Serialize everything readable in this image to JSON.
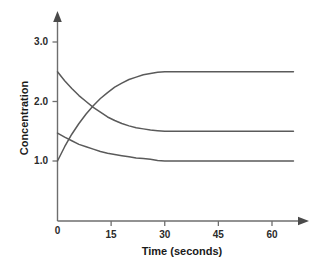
{
  "chart_data": {
    "type": "line",
    "title": "",
    "subtitle": "",
    "xlabel": "Time (seconds)",
    "ylabel": "Concentration",
    "xlim": [
      0,
      68
    ],
    "ylim": [
      0,
      3.35
    ],
    "grid": false,
    "legend": null,
    "x_ticks": [
      {
        "value": 0,
        "label": "0"
      },
      {
        "value": 15,
        "label": "15"
      },
      {
        "value": 30,
        "label": "30"
      },
      {
        "value": 45,
        "label": "45"
      },
      {
        "value": 60,
        "label": "60"
      }
    ],
    "y_ticks": [
      {
        "value": 1.0,
        "label": "1.0"
      },
      {
        "value": 2.0,
        "label": "2.0"
      },
      {
        "value": 3.0,
        "label": "3.0"
      }
    ],
    "axis_arrows": true,
    "line_color": "#5a5a5a",
    "axis_color": "#6e6e6e",
    "series": [
      {
        "name": "decreasing-upper",
        "start_value": 2.5,
        "equilibrium_value": 1.5,
        "direction": "decreasing",
        "x": [
          0,
          2,
          4,
          6,
          8,
          10,
          12,
          14,
          16,
          18,
          20,
          22,
          24,
          26,
          28,
          30,
          40,
          50,
          60,
          66
        ],
        "values": [
          2.5,
          2.35,
          2.22,
          2.1,
          2.0,
          1.9,
          1.82,
          1.74,
          1.68,
          1.63,
          1.59,
          1.56,
          1.54,
          1.52,
          1.51,
          1.5,
          1.5,
          1.5,
          1.5,
          1.5
        ]
      },
      {
        "name": "increasing",
        "start_value": 1.0,
        "equilibrium_value": 2.5,
        "direction": "increasing",
        "x": [
          0,
          2,
          4,
          6,
          8,
          10,
          12,
          14,
          16,
          18,
          20,
          22,
          24,
          26,
          28,
          30,
          40,
          50,
          60,
          66
        ],
        "values": [
          1.0,
          1.24,
          1.45,
          1.63,
          1.79,
          1.93,
          2.05,
          2.15,
          2.24,
          2.31,
          2.37,
          2.41,
          2.45,
          2.47,
          2.49,
          2.5,
          2.5,
          2.5,
          2.5,
          2.5
        ]
      },
      {
        "name": "decreasing-lower",
        "start_value": 1.47,
        "equilibrium_value": 1.0,
        "direction": "decreasing",
        "x": [
          0,
          2,
          4,
          6,
          8,
          10,
          12,
          14,
          16,
          18,
          20,
          22,
          24,
          26,
          28,
          30,
          40,
          50,
          60,
          66
        ],
        "values": [
          1.47,
          1.4,
          1.34,
          1.28,
          1.24,
          1.2,
          1.16,
          1.13,
          1.11,
          1.09,
          1.07,
          1.05,
          1.04,
          1.03,
          1.01,
          1.0,
          1.0,
          1.0,
          1.0,
          1.0
        ]
      }
    ]
  },
  "axis": {
    "y_label": "Concentration",
    "x_label": "Time (seconds)",
    "y_tick_labels": [
      "3.0",
      "2.0",
      "1.0"
    ],
    "x_tick_labels": [
      "0",
      "15",
      "30",
      "45",
      "60"
    ]
  }
}
